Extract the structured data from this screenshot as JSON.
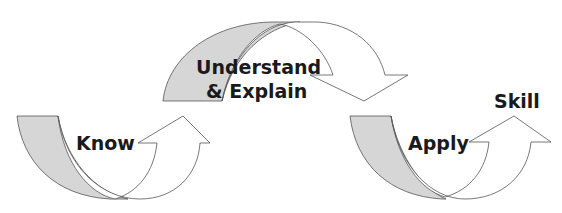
{
  "diagram": {
    "colors": {
      "background": "#ffffff",
      "stroke": "#555555",
      "tail_fill": "#d6d6d6",
      "arrow_fill": "#ffffff",
      "text": "#1a1a1a"
    },
    "arrows": [
      {
        "id": "know",
        "label": "Know",
        "direction": "curved up-right"
      },
      {
        "id": "understand",
        "label_line1": "Understand",
        "label_line2": "& Explain",
        "direction": "curved over, down-right"
      },
      {
        "id": "apply",
        "label": "Apply",
        "direction": "curved up-right"
      }
    ],
    "end_label": "Skill"
  }
}
